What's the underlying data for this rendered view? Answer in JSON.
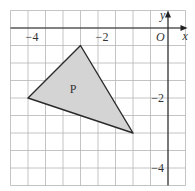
{
  "diagram": {
    "type": "coordinate-grid",
    "grid_step_units": 0.5,
    "x_range": [
      -4.5,
      0.5
    ],
    "y_range": [
      -4.5,
      0.5
    ],
    "axes": {
      "x_label": "x",
      "y_label": "y",
      "origin_label": "O"
    },
    "x_ticks": [
      {
        "value": -4,
        "label": "−4"
      },
      {
        "value": -2,
        "label": "−2"
      }
    ],
    "y_ticks": [
      {
        "value": -2,
        "label": "−2"
      },
      {
        "value": -4,
        "label": "−4"
      }
    ],
    "shape": {
      "name": "P",
      "label": "P",
      "vertices": [
        [
          -2.5,
          -0.5
        ],
        [
          -4,
          -2
        ],
        [
          -1,
          -3
        ]
      ],
      "fill": "#d4d4d4",
      "stroke": "#2a2a2a"
    }
  }
}
